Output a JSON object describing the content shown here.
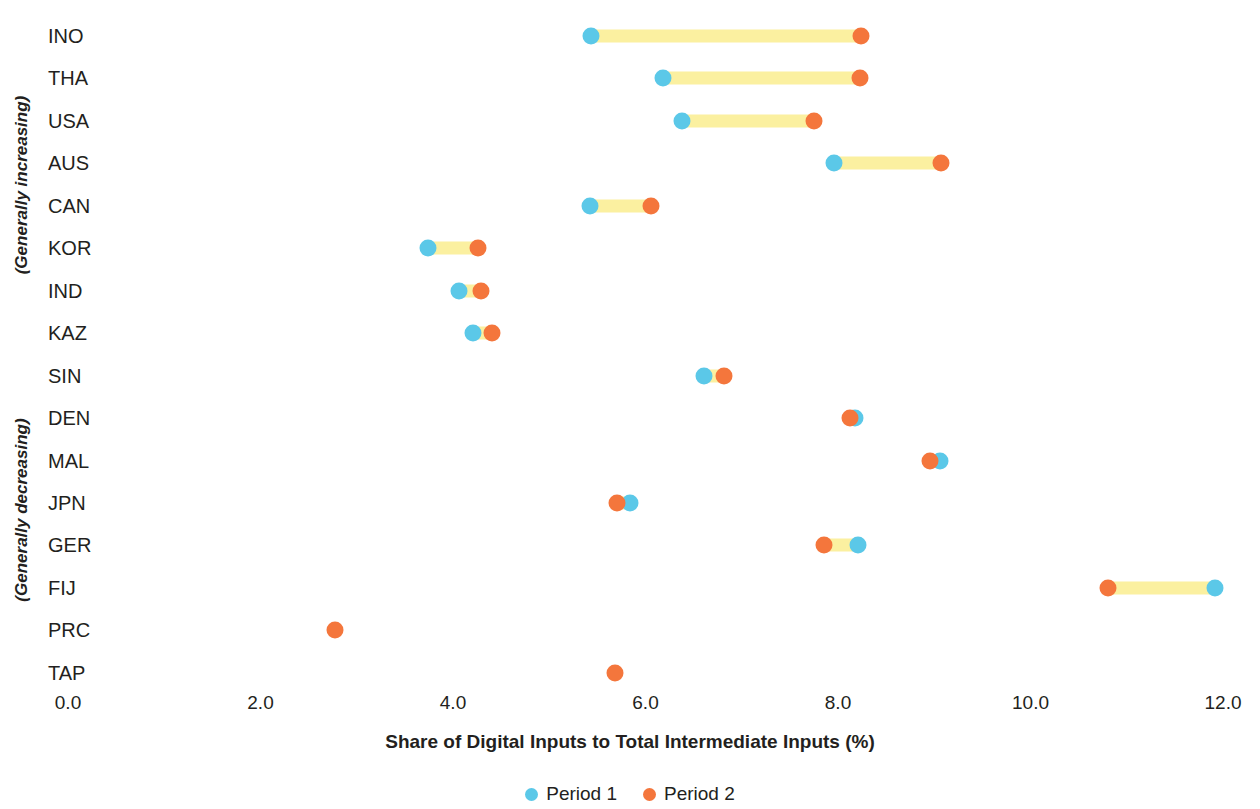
{
  "chart_data": {
    "type": "scatter",
    "subtype": "dumbbell",
    "title": "",
    "xlabel": "Share of Digital Inputs to Total Intermediate Inputs (%)",
    "ylabel": "",
    "xlim": [
      0.0,
      12.4
    ],
    "xticks": [
      0.0,
      2.0,
      4.0,
      6.0,
      8.0,
      10.0,
      12.0
    ],
    "xtick_labels": [
      "0.0",
      "2.0",
      "4.0",
      "6.0",
      "8.0",
      "10.0",
      "12.0"
    ],
    "grid": false,
    "legend_position": "bottom",
    "series": [
      {
        "name": "Period 1",
        "color": "#5bc8e8"
      },
      {
        "name": "Period 2",
        "color": "#f4763c"
      }
    ],
    "connector_color": "#fbf0a0",
    "categories": [
      "INO",
      "THA",
      "USA",
      "AUS",
      "CAN",
      "KOR",
      "IND",
      "KAZ",
      "SIN",
      "DEN",
      "MAL",
      "JPN",
      "GER",
      "FIJ",
      "PRC",
      "TAP"
    ],
    "rows": [
      {
        "label": "INO",
        "group": "increasing",
        "period1": 5.43,
        "period2": 8.24
      },
      {
        "label": "THA",
        "group": "increasing",
        "period1": 6.18,
        "period2": 8.23
      },
      {
        "label": "USA",
        "group": "increasing",
        "period1": 6.38,
        "period2": 7.75
      },
      {
        "label": "AUS",
        "group": "increasing",
        "period1": 7.96,
        "period2": 9.07
      },
      {
        "label": "CAN",
        "group": "increasing",
        "period1": 5.42,
        "period2": 6.06
      },
      {
        "label": "KOR",
        "group": "increasing",
        "period1": 3.74,
        "period2": 4.26
      },
      {
        "label": "IND",
        "group": "increasing",
        "period1": 4.06,
        "period2": 4.29
      },
      {
        "label": "KAZ",
        "group": "increasing",
        "period1": 4.21,
        "period2": 4.41
      },
      {
        "label": "SIN",
        "group": "increasing",
        "period1": 6.61,
        "period2": 6.82
      },
      {
        "label": "DEN",
        "group": "decreasing",
        "period1": 8.18,
        "period2": 8.12
      },
      {
        "label": "MAL",
        "group": "decreasing",
        "period1": 9.06,
        "period2": 8.96
      },
      {
        "label": "JPN",
        "group": "decreasing",
        "period1": 5.84,
        "period2": 5.7
      },
      {
        "label": "GER",
        "group": "decreasing",
        "period1": 8.21,
        "period2": 7.85
      },
      {
        "label": "FIJ",
        "group": "decreasing",
        "period1": 11.92,
        "period2": 10.81
      },
      {
        "label": "PRC",
        "group": "decreasing",
        "period1": null,
        "period2": 2.77
      },
      {
        "label": "TAP",
        "group": "decreasing",
        "period1": null,
        "period2": 5.68
      }
    ],
    "group_labels": [
      {
        "key": "increasing",
        "text": "(Generally increasing)"
      },
      {
        "key": "decreasing",
        "text": "(Generally decreasing)"
      }
    ]
  },
  "legend": {
    "items": [
      {
        "label": "Period 1",
        "color": "#5bc8e8"
      },
      {
        "label": "Period 2",
        "color": "#f4763c"
      }
    ]
  },
  "axis": {
    "x_title": "Share of Digital Inputs to Total Intermediate Inputs (%)"
  }
}
